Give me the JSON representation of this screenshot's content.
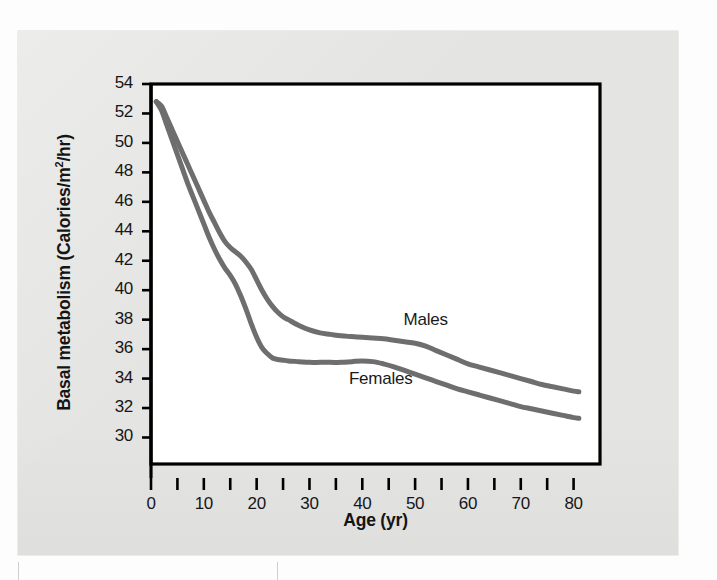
{
  "figure": {
    "background_color": "#e4e4e2",
    "plot_background_color": "#ffffff",
    "frame_color": "#000000",
    "curve_color": "#6e6e6e"
  },
  "chart_data": {
    "type": "line",
    "title": "",
    "subtitle": "",
    "xlabel": "Age (yr)",
    "ylabel": "Basal metabolism (Calories/m2/hr)",
    "ylabel_display": "Basal metabolism (Calories/m",
    "ylabel_superscript": "2",
    "ylabel_suffix": "/hr)",
    "xlim": [
      0,
      85
    ],
    "ylim": [
      28.2,
      54
    ],
    "xticks": [
      0,
      5,
      10,
      15,
      20,
      25,
      30,
      35,
      40,
      45,
      50,
      55,
      60,
      65,
      70,
      75,
      80
    ],
    "xtick_labels": [
      "0",
      "",
      "10",
      "",
      "20",
      "",
      "30",
      "",
      "40",
      "",
      "50",
      "",
      "60",
      "",
      "70",
      "",
      "80"
    ],
    "xtick_labels_major": [
      "0",
      "10",
      "20",
      "30",
      "40",
      "50",
      "60",
      "70",
      "80"
    ],
    "xticks_major": [
      0,
      10,
      20,
      30,
      40,
      50,
      60,
      70,
      80
    ],
    "yticks": [
      30,
      32,
      34,
      36,
      38,
      40,
      42,
      44,
      46,
      48,
      50,
      52,
      54
    ],
    "ytick_labels": [
      "30",
      "32",
      "34",
      "36",
      "38",
      "40",
      "42",
      "44",
      "46",
      "48",
      "50",
      "52",
      "54"
    ],
    "grid": false,
    "legend_position": "inline-annotation",
    "series": [
      {
        "name": "Males",
        "label": "Males",
        "label_x": 52,
        "label_y": 37.9,
        "color": "#6e6e6e",
        "x": [
          1,
          2,
          3,
          4,
          5,
          6,
          7,
          8,
          9,
          10,
          11,
          12,
          13,
          14,
          15,
          16,
          17,
          18,
          19,
          20,
          21,
          22,
          23,
          24,
          25,
          26,
          28,
          30,
          32,
          34,
          36,
          38,
          40,
          42,
          44,
          46,
          48,
          50,
          52,
          54,
          56,
          58,
          60,
          62,
          64,
          66,
          68,
          70,
          72,
          74,
          76,
          78,
          80,
          81
        ],
        "y": [
          52.8,
          52.5,
          51.7,
          50.9,
          50.1,
          49.3,
          48.5,
          47.7,
          46.9,
          46.1,
          45.3,
          44.6,
          43.9,
          43.3,
          42.9,
          42.6,
          42.3,
          41.9,
          41.4,
          40.7,
          40.0,
          39.4,
          38.9,
          38.5,
          38.2,
          38.0,
          37.6,
          37.3,
          37.1,
          37.0,
          36.9,
          36.85,
          36.8,
          36.75,
          36.7,
          36.6,
          36.5,
          36.4,
          36.2,
          35.9,
          35.6,
          35.3,
          35.0,
          34.8,
          34.6,
          34.4,
          34.2,
          34.0,
          33.8,
          33.6,
          33.45,
          33.3,
          33.15,
          33.1
        ]
      },
      {
        "name": "Females",
        "label": "Females",
        "label_x": 43.5,
        "label_y": 33.9,
        "color": "#6e6e6e",
        "x": [
          1,
          2,
          3,
          4,
          5,
          6,
          7,
          8,
          9,
          10,
          11,
          12,
          13,
          14,
          15,
          16,
          17,
          18,
          19,
          20,
          21,
          22,
          23,
          24,
          25,
          26,
          28,
          30,
          32,
          34,
          36,
          38,
          40,
          42,
          44,
          46,
          48,
          50,
          52,
          54,
          56,
          58,
          60,
          62,
          64,
          66,
          68,
          70,
          72,
          74,
          76,
          78,
          80,
          81
        ],
        "y": [
          52.8,
          52.2,
          51.2,
          50.2,
          49.2,
          48.2,
          47.2,
          46.3,
          45.4,
          44.5,
          43.6,
          42.8,
          42.1,
          41.5,
          41.0,
          40.4,
          39.6,
          38.7,
          37.7,
          36.8,
          36.1,
          35.7,
          35.4,
          35.3,
          35.25,
          35.2,
          35.15,
          35.1,
          35.1,
          35.1,
          35.1,
          35.15,
          35.2,
          35.15,
          35.0,
          34.8,
          34.55,
          34.3,
          34.05,
          33.8,
          33.55,
          33.3,
          33.1,
          32.9,
          32.7,
          32.5,
          32.3,
          32.1,
          31.95,
          31.8,
          31.65,
          31.5,
          31.35,
          31.3
        ]
      }
    ],
    "annotations": [
      {
        "text": "Males",
        "x": 52,
        "y": 37.9
      },
      {
        "text": "Females",
        "x": 43.5,
        "y": 33.9
      }
    ]
  }
}
